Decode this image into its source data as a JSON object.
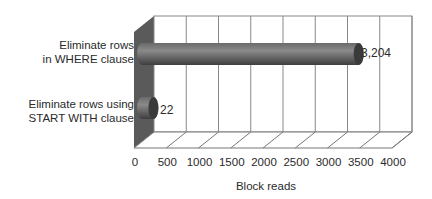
{
  "chart_data": {
    "type": "bar",
    "orientation": "horizontal",
    "style": "3d-cylinder",
    "title": "",
    "categories": [
      "Eliminate rows in WHERE clause",
      "Eliminate rows using START WITH clause"
    ],
    "category_label_lines": [
      [
        "Eliminate rows",
        "in WHERE clause"
      ],
      [
        "Eliminate rows using",
        "START WITH clause"
      ]
    ],
    "values": [
      3204,
      22
    ],
    "value_labels": [
      "3,204",
      "22"
    ],
    "xlabel": "Block reads",
    "ylabel": "",
    "xlim": [
      0,
      4000
    ],
    "x_ticks": [
      "0",
      "500",
      "1000",
      "1500",
      "2000",
      "2500",
      "3000",
      "3500",
      "4000"
    ],
    "grid": true,
    "legend": null
  }
}
